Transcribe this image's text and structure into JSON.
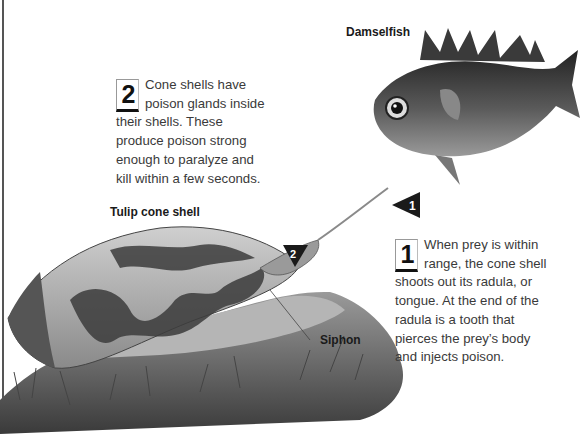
{
  "labels": {
    "damselfish": "Damselfish",
    "tulip_cone_shell": "Tulip cone shell",
    "siphon": "Siphon"
  },
  "captions": [
    {
      "number": "2",
      "text": "Cone shells have poison glands inside their shells. These produce poison strong enough to paralyze and kill within a few seconds."
    },
    {
      "number": "1",
      "text": "When prey is within range, the cone shell shoots out its radula, or tongue. At the end of the radula is a tooth that pierces the prey’s body and injects poison."
    }
  ],
  "markers": [
    {
      "number": "1",
      "shape": "left-pointing-triangle"
    },
    {
      "number": "2",
      "shape": "down-pointing-triangle"
    }
  ],
  "colors": {
    "background": "#ffffff",
    "text": "#3a3a3a",
    "marker": "#1a1a1a"
  }
}
